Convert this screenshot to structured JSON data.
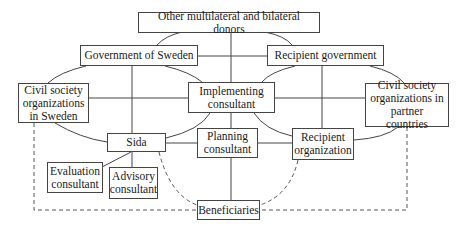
{
  "diagram": {
    "type": "stakeholder-relationship-diagram",
    "nodes": {
      "donors": {
        "label": "Other multilateral and bilateral donors"
      },
      "gov_sweden": {
        "label": "Government of Sweden"
      },
      "recipient_gov": {
        "label": "Recipient government"
      },
      "cso_sweden": {
        "label": "Civil society\norganizations\nin Sweden"
      },
      "implementing": {
        "label": "Implementing\nconsultant"
      },
      "cso_partner": {
        "label": "Civil society\norganizations in\npartner countries"
      },
      "sida": {
        "label": "Sida"
      },
      "planning": {
        "label": "Planning\nconsultant"
      },
      "recipient_org": {
        "label": "Recipient\norganization"
      },
      "evaluation": {
        "label": "Evaluation\nconsultant"
      },
      "advisory": {
        "label": "Advisory\nconsultant"
      },
      "beneficiaries": {
        "label": "Beneficiaries"
      }
    },
    "edges": [
      {
        "from": "donors",
        "to": "gov_sweden",
        "style": "solid-curve"
      },
      {
        "from": "donors",
        "to": "recipient_gov",
        "style": "solid-curve"
      },
      {
        "from": "donors",
        "to": "implementing",
        "style": "solid"
      },
      {
        "from": "gov_sweden",
        "to": "recipient_gov",
        "style": "solid"
      },
      {
        "from": "gov_sweden",
        "to": "cso_sweden",
        "style": "solid-curve"
      },
      {
        "from": "gov_sweden",
        "to": "implementing",
        "style": "solid-curve"
      },
      {
        "from": "gov_sweden",
        "to": "sida",
        "style": "solid"
      },
      {
        "from": "recipient_gov",
        "to": "implementing",
        "style": "solid-curve"
      },
      {
        "from": "recipient_gov",
        "to": "cso_partner",
        "style": "solid-curve"
      },
      {
        "from": "recipient_gov",
        "to": "recipient_org",
        "style": "solid"
      },
      {
        "from": "cso_sweden",
        "to": "implementing",
        "style": "solid"
      },
      {
        "from": "implementing",
        "to": "cso_partner",
        "style": "solid"
      },
      {
        "from": "cso_sweden",
        "to": "sida",
        "style": "solid-curve"
      },
      {
        "from": "implementing",
        "to": "sida",
        "style": "solid-curve"
      },
      {
        "from": "implementing",
        "to": "recipient_org",
        "style": "solid-curve"
      },
      {
        "from": "cso_partner",
        "to": "recipient_org",
        "style": "solid-curve"
      },
      {
        "from": "implementing",
        "to": "planning",
        "style": "solid"
      },
      {
        "from": "sida",
        "to": "planning",
        "style": "solid"
      },
      {
        "from": "planning",
        "to": "recipient_org",
        "style": "solid"
      },
      {
        "from": "sida",
        "to": "evaluation",
        "style": "solid"
      },
      {
        "from": "sida",
        "to": "advisory",
        "style": "solid"
      },
      {
        "from": "planning",
        "to": "beneficiaries",
        "style": "solid"
      },
      {
        "from": "sida",
        "to": "beneficiaries",
        "style": "dashed-curve"
      },
      {
        "from": "recipient_org",
        "to": "beneficiaries",
        "style": "dashed-curve"
      },
      {
        "from": "cso_sweden",
        "to": "beneficiaries",
        "style": "dashed"
      },
      {
        "from": "cso_partner",
        "to": "beneficiaries",
        "style": "dashed"
      }
    ]
  }
}
